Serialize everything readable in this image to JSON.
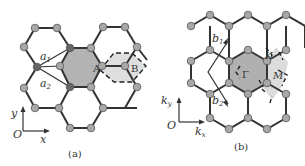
{
  "figure": {
    "panels": [
      {
        "id": "a",
        "caption": "(a)",
        "title": "Real-space honeycomb lattice",
        "labels": {
          "a1": "a",
          "a1_sub": "1",
          "a2": "a",
          "a2_sub": "2",
          "site_A": "A",
          "site_B": "B",
          "origin": "O",
          "x_axis": "x",
          "y_axis": "y"
        }
      },
      {
        "id": "b",
        "caption": "(b)",
        "title": "Reciprocal lattice / Brillouin zone",
        "labels": {
          "b1": "b",
          "b1_sub": "1",
          "b2": "b",
          "b2_sub": "2",
          "gamma": "Γ",
          "K": "K",
          "M": "M",
          "origin": "O",
          "kx": "k",
          "kx_sub": "x",
          "ky": "k",
          "ky_sub": "y"
        }
      }
    ],
    "colors": {
      "bond": "#333333",
      "atom_fill": "#a8a8a8",
      "atom_stroke": "#555555",
      "cell_fill": "#b0b0b0",
      "light_fill": "#dcdcdc",
      "dashed": "#222222"
    }
  }
}
